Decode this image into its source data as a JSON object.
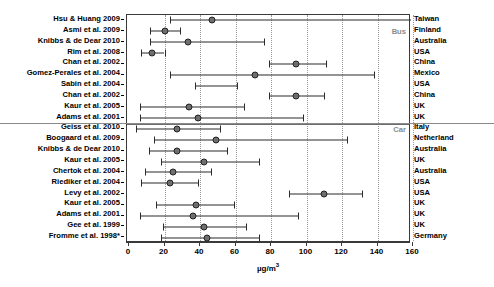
{
  "chart_data": {
    "type": "scatter",
    "title": "",
    "xlabel": "µg/m³",
    "ylabel": "",
    "xlim": [
      0,
      160
    ],
    "xticks": [
      0,
      20,
      40,
      60,
      80,
      100,
      120,
      140,
      160
    ],
    "xticklabels": [
      "0",
      "20",
      "40",
      "60",
      "80",
      "100",
      "120",
      "140",
      "160"
    ],
    "grid": "vertical-dotted",
    "legend": "none",
    "group_labels": [
      "Bus",
      "Car"
    ],
    "group_divider_after_row": 10,
    "categories": [
      "Hsu & Huang 2009",
      "Asmi et al. 2009",
      "Knibbs & de Dear 2010",
      "Rim et al. 2008",
      "Chan et al. 2002",
      "Gomez-Perales et al. 2004",
      "Sabin et al. 2004",
      "Chan et al. 2002",
      "Kaur et al. 2005",
      "Adams et al. 2001",
      "Geiss et al. 2010",
      "Boogaard et al. 2009",
      "Knibbs & de Dear 2010",
      "Kaur et al. 2005",
      "Chertok et al. 2004",
      "Riediker et al. 2004",
      "Levy et al. 2002",
      "Kaur et al. 2005",
      "Adams et al. 2001",
      "Gee et al. 1999",
      "Fromme et al. 1998*"
    ],
    "countries": [
      "Taiwan",
      "Finland",
      "Australia",
      "USA",
      "China",
      "Mexico",
      "USA",
      "China",
      "UK",
      "UK",
      "Italy",
      "Netherland",
      "Australia",
      "UK",
      "Australia",
      "USA",
      "USA",
      "UK",
      "UK",
      "UK",
      "Germany"
    ],
    "rows": [
      {
        "label": "Hsu & Huang 2009",
        "country": "Taiwan",
        "group": "Bus",
        "mean": 47,
        "low": 23,
        "high": 159,
        "high_clipped": true,
        "marker": true
      },
      {
        "label": "Asmi et al. 2009",
        "country": "Finland",
        "group": "Bus",
        "mean": 20,
        "low": 12,
        "high": 29,
        "high_clipped": false,
        "marker": true
      },
      {
        "label": "Knibbs & de Dear 2010",
        "country": "Australia",
        "group": "Bus",
        "mean": 33,
        "low": 12,
        "high": 76,
        "high_clipped": false,
        "marker": true
      },
      {
        "label": "Rim et al. 2008",
        "country": "USA",
        "group": "Bus",
        "mean": 13,
        "low": 7,
        "high": 20,
        "high_clipped": false,
        "marker": true
      },
      {
        "label": "Chan et al. 2002",
        "country": "China",
        "group": "Bus",
        "mean": 94,
        "low": 79,
        "high": 111,
        "high_clipped": false,
        "marker": true
      },
      {
        "label": "Gomez-Perales et al. 2004",
        "country": "Mexico",
        "group": "Bus",
        "mean": 71,
        "low": 23,
        "high": 138,
        "high_clipped": false,
        "marker": true
      },
      {
        "label": "Sabin et al. 2004",
        "country": "USA",
        "group": "Bus",
        "mean": null,
        "low": 37,
        "high": 61,
        "high_clipped": false,
        "marker": false
      },
      {
        "label": "Chan et al. 2002",
        "country": "China",
        "group": "Bus",
        "mean": 94,
        "low": 79,
        "high": 110,
        "high_clipped": false,
        "marker": true
      },
      {
        "label": "Kaur et al. 2005",
        "country": "UK",
        "group": "Bus",
        "mean": 34,
        "low": 6,
        "high": 65,
        "high_clipped": false,
        "marker": true
      },
      {
        "label": "Adams et al. 2001",
        "country": "UK",
        "group": "Bus",
        "mean": 39,
        "low": 6,
        "high": 98,
        "high_clipped": false,
        "marker": true
      },
      {
        "label": "Geiss et al. 2010",
        "country": "Italy",
        "group": "Car",
        "mean": 27,
        "low": 4,
        "high": 51,
        "high_clipped": false,
        "marker": true
      },
      {
        "label": "Boogaard et al. 2009",
        "country": "Netherland",
        "group": "Car",
        "mean": 49,
        "low": 14,
        "high": 123,
        "high_clipped": false,
        "marker": true
      },
      {
        "label": "Knibbs & de Dear 2010",
        "country": "Australia",
        "group": "Car",
        "mean": 27,
        "low": 11,
        "high": 55,
        "high_clipped": false,
        "marker": true
      },
      {
        "label": "Kaur et al. 2005",
        "country": "UK",
        "group": "Car",
        "mean": 42,
        "low": 18,
        "high": 73,
        "high_clipped": false,
        "marker": true
      },
      {
        "label": "Chertok et al. 2004",
        "country": "Australia",
        "group": "Car",
        "mean": 25,
        "low": 9,
        "high": 46,
        "high_clipped": false,
        "marker": true
      },
      {
        "label": "Riediker et al. 2004",
        "country": "USA",
        "group": "Car",
        "mean": 23,
        "low": 7,
        "high": 39,
        "high_clipped": false,
        "marker": true
      },
      {
        "label": "Levy et al. 2002",
        "country": "USA",
        "group": "Car",
        "mean": 110,
        "low": 90,
        "high": 131,
        "high_clipped": false,
        "marker": true
      },
      {
        "label": "Kaur et al. 2005",
        "country": "UK",
        "group": "Car",
        "mean": 38,
        "low": 15,
        "high": 59,
        "high_clipped": false,
        "marker": true
      },
      {
        "label": "Adams et al. 2001",
        "country": "UK",
        "group": "Car",
        "mean": 36,
        "low": 6,
        "high": 95,
        "high_clipped": false,
        "marker": true
      },
      {
        "label": "Gee et al. 1999",
        "country": "UK",
        "group": "Car",
        "mean": 42,
        "low": 19,
        "high": 66,
        "high_clipped": false,
        "marker": true
      },
      {
        "label": "Fromme et al. 1998*",
        "country": "Germany",
        "group": "Car",
        "mean": 44,
        "low": 18,
        "high": 73,
        "high_clipped": false,
        "marker": true
      }
    ]
  },
  "axis": {
    "unit_label": "µg/m",
    "unit_sup": "3"
  },
  "colors": {
    "marker_fill": "#6e6e6e",
    "marker_edge": "#222222",
    "line": "#2b2b2b",
    "grid": "#9a9a9a",
    "frame": "#3a3a3a",
    "group_label": "#8a8a8a"
  }
}
